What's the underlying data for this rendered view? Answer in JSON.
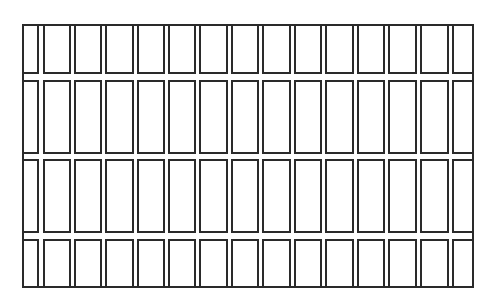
{
  "diagram": {
    "type": "grid-pattern",
    "colors": {
      "stroke": "#2a2a2a",
      "background": "#ffffff"
    },
    "frame": {
      "left": 22,
      "top": 24,
      "right": 474,
      "bottom": 288
    },
    "rows": [
      {
        "top": 24,
        "bottom": 74
      },
      {
        "top": 80,
        "bottom": 154
      },
      {
        "top": 159,
        "bottom": 233
      },
      {
        "top": 239,
        "bottom": 288
      }
    ],
    "columns": [
      {
        "left": 22,
        "right": 39
      },
      {
        "left": 43,
        "right": 71
      },
      {
        "left": 74,
        "right": 102
      },
      {
        "left": 105,
        "right": 134
      },
      {
        "left": 137,
        "right": 165
      },
      {
        "left": 168,
        "right": 196
      },
      {
        "left": 199,
        "right": 228
      },
      {
        "left": 231,
        "right": 259
      },
      {
        "left": 262,
        "right": 291
      },
      {
        "left": 294,
        "right": 322
      },
      {
        "left": 325,
        "right": 354
      },
      {
        "left": 357,
        "right": 385
      },
      {
        "left": 388,
        "right": 417
      },
      {
        "left": 420,
        "right": 449
      },
      {
        "left": 452,
        "right": 474
      }
    ],
    "row_count": 4,
    "column_count": 15
  }
}
